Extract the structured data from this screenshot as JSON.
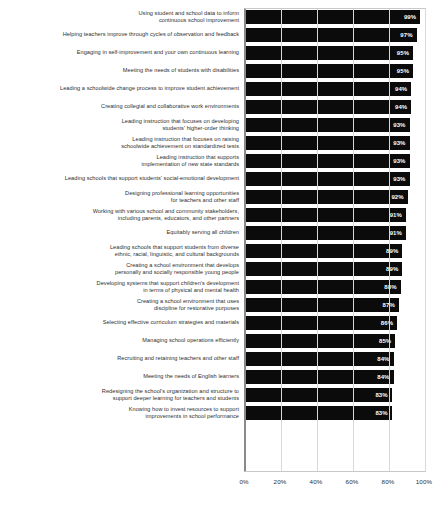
{
  "chart_data": {
    "type": "bar",
    "orientation": "horizontal",
    "title": "",
    "xlabel": "",
    "ylabel": "",
    "xlim": [
      0,
      100
    ],
    "grid": true,
    "legend": false,
    "value_suffix": "%",
    "xticks": [
      "0%",
      "20%",
      "40%",
      "60%",
      "80%",
      "100%"
    ],
    "xtick_values": [
      0,
      20,
      40,
      60,
      80,
      100
    ],
    "bar_color": "#0b0b0b",
    "value_label_color": "#ffffff",
    "categories": [
      "Using student and school data to inform\ncontinuous school improvement",
      "Helping teachers improve through cycles of observation and feedback",
      "Engaging in self-improvement and your own continuous learning",
      "Meeting the needs of students with disabilities",
      "Leading a schoolwide change process to improve student achievement",
      "Creating collegial and collaborative work environments",
      "Leading instruction that focuses on developing\nstudents' higher-order thinking",
      "Leading instruction that focuses on raising\nschoolwide achievement on standardized tests",
      "Leading instruction that supports\nimplementation of new state standards",
      "Leading schools that support students' social-emotional development",
      "Designing professional learning opportunities\nfor teachers and other staff",
      "Working with various school and community stakeholders,\nincluding parents, educators, and other partners",
      "Equitably serving all children",
      "Leading schools that support students from diverse\nethnic, racial, linguistic, and cultural backgrounds",
      "Creating a school environment that develops\npersonally and socially responsible young people",
      "Developing systems that support children's development\nin terms of physical and mental health",
      "Creating a school environment that uses\ndiscipline for restorative purposes",
      "Selecting effective curriculum strategies and materials",
      "Managing school operations efficiently",
      "Recruiting and retaining teachers and other staff",
      "Meeting the needs of English learners",
      "Redesigning the school's organization and structure to\nsupport deeper learning for teachers and students",
      "Knowing how to invest resources to support\nimprovements in school performance"
    ],
    "values": [
      99,
      97,
      95,
      95,
      94,
      94,
      93,
      93,
      93,
      93,
      92,
      91,
      91,
      89,
      89,
      88,
      87,
      86,
      85,
      84,
      84,
      83,
      83
    ],
    "value_labels": [
      "99%",
      "97%",
      "95%",
      "95%",
      "94%",
      "94%",
      "93%",
      "93%",
      "93%",
      "93%",
      "92%",
      "91%",
      "91%",
      "89%",
      "89%",
      "88%",
      "87%",
      "86%",
      "85%",
      "84%",
      "84%",
      "83%",
      "83%"
    ]
  }
}
